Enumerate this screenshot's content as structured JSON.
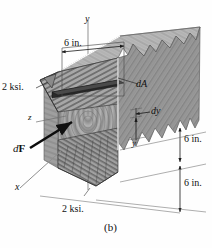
{
  "figure": {
    "caption": "(b)"
  },
  "axes": {
    "y_label": "y",
    "x_label": "x",
    "z_label": "z"
  },
  "annotations": {
    "width_top": "6 in.",
    "stress_top": "2 ksi.",
    "stress_bottom": "2 ksi.",
    "force": "dF",
    "force_prefix": "d",
    "force_bold": "F",
    "area": "dA",
    "differential_y": "dy",
    "coordinate_y": "y",
    "depth_upper": "6 in.",
    "depth_lower": "6 in."
  },
  "colors": {
    "ink": "#101010",
    "wood_top": "#b5b5b5",
    "wood_side": "#8f8f8f",
    "wood_end": "#a2a2a2",
    "wedge": "#9a9a9a",
    "dark_band": "#2a2a2a",
    "line": "#444444",
    "white_edge": "#ffffff"
  }
}
